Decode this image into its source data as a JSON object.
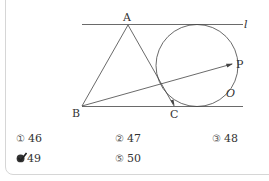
{
  "figure": {
    "labels": {
      "A": "A",
      "B": "B",
      "C": "C",
      "P": "P",
      "O": "O",
      "l": "l"
    }
  },
  "options": [
    {
      "marker": "①",
      "value": "46",
      "selected": false
    },
    {
      "marker": "②",
      "value": "47",
      "selected": false
    },
    {
      "marker": "③",
      "value": "48",
      "selected": false
    },
    {
      "marker": "④",
      "value": "49",
      "selected": true
    },
    {
      "marker": "⑤",
      "value": "50",
      "selected": false
    }
  ]
}
